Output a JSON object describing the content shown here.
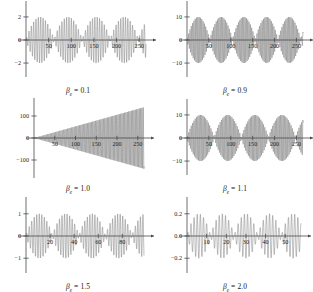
{
  "figure": {
    "title": "",
    "background": "#ffffff",
    "curve_color": "#6d6d6d",
    "axis_color": "#4a4a4a",
    "rows": 3,
    "cols": 2
  },
  "chart_data": [
    {
      "type": "line",
      "title": "",
      "caption": "β",
      "caption_sub": "e",
      "caption_value": " = 0.1",
      "beta_e": 0.1,
      "xlabel": "t",
      "ylabel": "z",
      "xlim": [
        0,
        265
      ],
      "ylim": [
        -2.6,
        2.6
      ],
      "xticks": [
        50,
        100,
        150,
        200,
        250
      ],
      "xticklabels": [
        "50",
        "100",
        "150",
        "200",
        "250"
      ],
      "yticks": [
        2,
        0,
        -2
      ],
      "yticklabels": [
        "2",
        "0",
        "−2"
      ],
      "grid": false,
      "legend": "none",
      "description": "beating oscillation, amplitude modulated envelope with 4 beat packets, peak amplitude 2",
      "envelope_period": 62,
      "carrier_period": 5.2,
      "amplitude": 2.0,
      "growth": "none"
    },
    {
      "type": "line",
      "title": "",
      "caption": "β",
      "caption_sub": "e",
      "caption_value": " = 0.9",
      "beta_e": 0.9,
      "xlabel": "t",
      "ylabel": "z",
      "xlim": [
        0,
        265
      ],
      "ylim": [
        -13,
        13
      ],
      "xticks": [
        50,
        100,
        150,
        200,
        250
      ],
      "xticklabels": [
        "50",
        "100",
        "150",
        "200",
        "250"
      ],
      "yticks": [
        10,
        0,
        -10
      ],
      "yticklabels": [
        "10",
        "0",
        "−10"
      ],
      "grid": false,
      "legend": "none",
      "description": "beating oscillation with 5 dense beat packets, peak amplitude 10",
      "envelope_period": 52,
      "carrier_period": 3.0,
      "amplitude": 10.0,
      "growth": "none"
    },
    {
      "type": "line",
      "title": "",
      "caption": "β",
      "caption_sub": "e",
      "caption_value": " = 1.0",
      "beta_e": 1.0,
      "xlabel": "t",
      "ylabel": "z",
      "xlim": [
        0,
        265
      ],
      "ylim": [
        -150,
        150
      ],
      "xticks": [
        50,
        100,
        150,
        200,
        250
      ],
      "xticklabels": [
        "50",
        "100",
        "150",
        "200",
        "250"
      ],
      "yticks": [
        100,
        0,
        -100
      ],
      "yticklabels": [
        "100",
        "0",
        "−100"
      ],
      "grid": false,
      "legend": "none",
      "description": "linearly growing resonance, amplitude grows from 0 to about 140 at t=250",
      "envelope_period": 0,
      "carrier_period": 3.2,
      "amplitude": 140.0,
      "growth": "linear"
    },
    {
      "type": "line",
      "title": "",
      "caption": "β",
      "caption_sub": "e",
      "caption_value": " = 1.1",
      "beta_e": 1.1,
      "xlabel": "t",
      "ylabel": "z",
      "xlim": [
        0,
        265
      ],
      "ylim": [
        -13,
        13
      ],
      "xticks": [
        50,
        100,
        150,
        200,
        250
      ],
      "xticklabels": [
        "50",
        "100",
        "150",
        "200",
        "250"
      ],
      "yticks": [
        10,
        0,
        -10
      ],
      "yticklabels": [
        "10",
        "0",
        "−10"
      ],
      "grid": false,
      "legend": "none",
      "description": "beating oscillation with 4 broad beat packets, peak amplitude 10",
      "envelope_period": 62,
      "carrier_period": 3.0,
      "amplitude": 10.0,
      "growth": "none"
    },
    {
      "type": "line",
      "title": "",
      "caption": "β",
      "caption_sub": "e",
      "caption_value": " = 1.5",
      "beta_e": 1.5,
      "xlabel": "t",
      "ylabel": "z",
      "xlim": [
        0,
        98
      ],
      "ylim": [
        -1.35,
        1.35
      ],
      "xticks": [
        20,
        40,
        60,
        80
      ],
      "xticklabels": [
        "20",
        "40",
        "60",
        "80"
      ],
      "yticks": [
        1,
        0,
        -1
      ],
      "yticklabels": [
        "1",
        "0",
        "−1"
      ],
      "grid": false,
      "legend": "none",
      "description": "beating oscillation with rapid carrier, peak amplitude 1",
      "envelope_period": 22,
      "carrier_period": 2.1,
      "amplitude": 1.0,
      "growth": "none"
    },
    {
      "type": "line",
      "title": "",
      "caption": "β",
      "caption_sub": "e",
      "caption_value": " = 2.0",
      "beta_e": 2.0,
      "xlabel": "t",
      "ylabel": "z",
      "xlim": [
        0,
        58
      ],
      "ylim": [
        -0.27,
        0.27
      ],
      "xticks": [
        10,
        20,
        30,
        40,
        50
      ],
      "xticklabels": [
        "10",
        "20",
        "30",
        "40",
        "50"
      ],
      "yticks": [
        0.2,
        0.0,
        -0.2
      ],
      "yticklabels": [
        "0.2",
        "0.0",
        "−0.2"
      ],
      "grid": false,
      "legend": "none",
      "description": "beating oscillation with rapid carrier, peak amplitude 0.2",
      "envelope_period": 12,
      "carrier_period": 1.6,
      "amplitude": 0.2,
      "growth": "none"
    }
  ]
}
